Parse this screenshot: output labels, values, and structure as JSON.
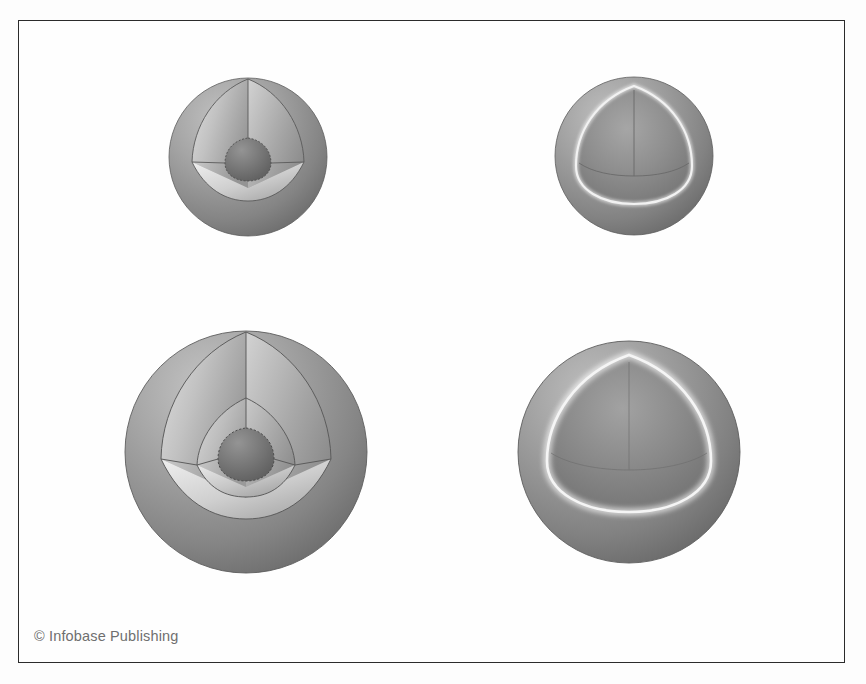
{
  "figure": {
    "background_color": "#fdfdfd",
    "frame_color": "#2b2b2b",
    "credit": "© Infobase Publishing"
  },
  "palette": {
    "outer_shell_light": "#b9b9b9",
    "outer_shell_mid": "#9a9a9a",
    "outer_shell_dark": "#6e6e6e",
    "cut_face_light": "#dcdcdc",
    "cut_face_mid": "#b4b4b4",
    "cut_face_dark": "#8b8b8b",
    "floor_light": "#e2e2e2",
    "floor_dark": "#9d9d9d",
    "mid_layer_light": "#cfcfcf",
    "mid_layer_dark": "#8f8f8f",
    "core_light": "#8a8a8a",
    "core_dark": "#5f5f5f",
    "edge_line": "#555555",
    "highlight_rim": "#f4f4f4",
    "hollow_cavity_dark": "#6b6b6b"
  },
  "spheres": [
    {
      "id": "sphere-top-left",
      "label": "Two-layer sphere with small core",
      "position": "top-left",
      "center_x": 248,
      "center_y": 157,
      "radius": 79,
      "layer_count": 2,
      "has_core": true,
      "core_radius_ratio": 0.28,
      "has_bright_rim": false,
      "hollow": false
    },
    {
      "id": "sphere-top-right",
      "label": "Hollow shell sphere with bright cut rim",
      "position": "top-right",
      "center_x": 634,
      "center_y": 156,
      "radius": 79,
      "layer_count": 1,
      "has_core": false,
      "core_radius_ratio": 0,
      "has_bright_rim": true,
      "hollow": true
    },
    {
      "id": "sphere-bottom-left",
      "label": "Three-layer sphere with mantle and core",
      "position": "bottom-left",
      "center_x": 246,
      "center_y": 452,
      "radius": 121,
      "layer_count": 3,
      "has_core": true,
      "core_radius_ratio": 0.22,
      "mid_radius_ratio": 0.56,
      "has_bright_rim": false,
      "hollow": false
    },
    {
      "id": "sphere-bottom-right",
      "label": "Large hollow shell sphere with bright cut rim",
      "position": "bottom-right",
      "center_x": 629,
      "center_y": 452,
      "radius": 111,
      "layer_count": 1,
      "has_core": false,
      "core_radius_ratio": 0,
      "has_bright_rim": true,
      "hollow": true
    }
  ]
}
